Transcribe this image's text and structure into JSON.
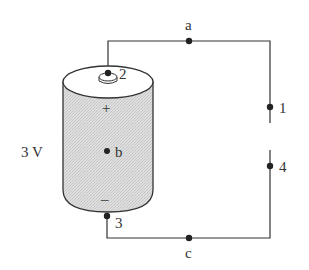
{
  "diagram": {
    "type": "circuit",
    "battery": {
      "voltage_label": "3 V",
      "positive_symbol": "+",
      "negative_symbol": "–",
      "center_point_label": "b"
    },
    "terminals": {
      "top": "2",
      "bottom": "3"
    },
    "nodes": {
      "a": "a",
      "c": "c",
      "one": "1",
      "four": "4"
    },
    "colors": {
      "wire": "#333333",
      "battery_fill": "#dadada",
      "battery_top": "#ffffff",
      "outline": "#333333"
    }
  }
}
